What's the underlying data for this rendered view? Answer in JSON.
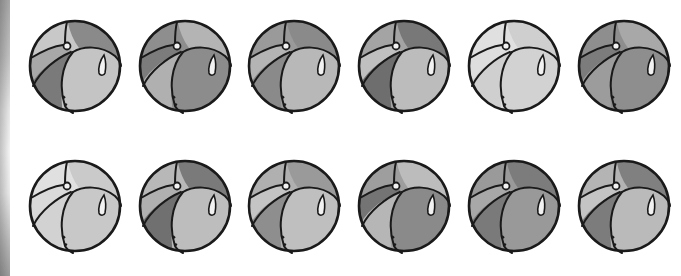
{
  "figure": {
    "rows": 2,
    "columns": 6
  },
  "balls": [
    {
      "row": 0,
      "col": 0,
      "x": 27,
      "y": 18,
      "shades": {
        "top_left": "#c8c8c8",
        "top_right": "#8a8a8a",
        "left": "#a8a8a8",
        "bottom_left": "#7a7a7a",
        "front": "#c4c4c4"
      }
    },
    {
      "row": 0,
      "col": 1,
      "x": 137,
      "y": 18,
      "shades": {
        "top_left": "#8e8e8e",
        "top_right": "#b4b4b4",
        "left": "#7c7c7c",
        "bottom_left": "#b0b0b0",
        "front": "#8c8c8c"
      }
    },
    {
      "row": 0,
      "col": 2,
      "x": 246,
      "y": 18,
      "shades": {
        "top_left": "#9a9a9a",
        "top_right": "#8a8a8a",
        "left": "#b4b4b4",
        "bottom_left": "#8a8a8a",
        "front": "#b8b8b8"
      }
    },
    {
      "row": 0,
      "col": 3,
      "x": 356,
      "y": 18,
      "shades": {
        "top_left": "#a4a4a4",
        "top_right": "#787878",
        "left": "#c0c0c0",
        "bottom_left": "#6e6e6e",
        "front": "#bcbcbc"
      }
    },
    {
      "row": 0,
      "col": 4,
      "x": 466,
      "y": 18,
      "shades": {
        "top_left": "#e0e0e0",
        "top_right": "#cfcfcf",
        "left": "#dedede",
        "bottom_left": "#cfcfcf",
        "front": "#d2d2d2"
      }
    },
    {
      "row": 0,
      "col": 5,
      "x": 576,
      "y": 18,
      "shades": {
        "top_left": "#8e8e8e",
        "top_right": "#a8a8a8",
        "left": "#7c7c7c",
        "bottom_left": "#9c9c9c",
        "front": "#8e8e8e"
      }
    },
    {
      "row": 1,
      "col": 0,
      "x": 27,
      "y": 158,
      "shades": {
        "top_left": "#e0e0e0",
        "top_right": "#cacaca",
        "left": "#dadada",
        "bottom_left": "#d2d2d2",
        "front": "#c8c8c8"
      }
    },
    {
      "row": 1,
      "col": 1,
      "x": 137,
      "y": 158,
      "shades": {
        "top_left": "#b8b8b8",
        "top_right": "#7a7a7a",
        "left": "#b0b0b0",
        "bottom_left": "#707070",
        "front": "#bdbdbd"
      }
    },
    {
      "row": 1,
      "col": 2,
      "x": 246,
      "y": 158,
      "shades": {
        "top_left": "#b0b0b0",
        "top_right": "#9a9a9a",
        "left": "#c4c4c4",
        "bottom_left": "#8e8e8e",
        "front": "#bfbfbf"
      }
    },
    {
      "row": 1,
      "col": 3,
      "x": 356,
      "y": 158,
      "shades": {
        "top_left": "#9e9e9e",
        "top_right": "#bcbcbc",
        "left": "#747474",
        "bottom_left": "#b6b6b6",
        "front": "#8a8a8a"
      }
    },
    {
      "row": 1,
      "col": 4,
      "x": 466,
      "y": 158,
      "shades": {
        "top_left": "#9a9a9a",
        "top_right": "#7c7c7c",
        "left": "#a8a8a8",
        "bottom_left": "#7a7a7a",
        "front": "#999999"
      }
    },
    {
      "row": 1,
      "col": 5,
      "x": 576,
      "y": 158,
      "shades": {
        "top_left": "#b4b4b4",
        "top_right": "#808080",
        "left": "#c4c4c4",
        "bottom_left": "#7c7c7c",
        "front": "#bababa"
      }
    }
  ],
  "colors": {
    "outline": "#1a1a1a",
    "highlight": "#f2f2f2",
    "background": "#ffffff"
  }
}
